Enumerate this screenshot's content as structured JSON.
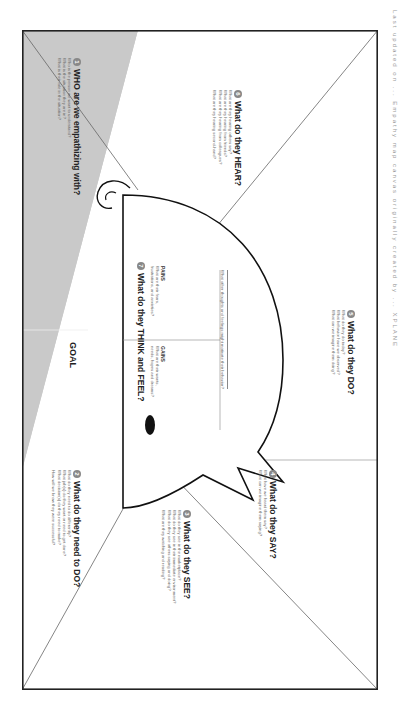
{
  "goal_label": "GOAL",
  "sections": {
    "who": {
      "number": "1",
      "title": "WHO are we empathizing with?",
      "questions": [
        "Who is the person we want to understand?",
        "What is the situation they are in?",
        "What is their role in the situation?"
      ]
    },
    "do_need": {
      "number": "2",
      "title": "What do they need to DO?",
      "questions": [
        "What do they need to do differently?",
        "What job(s) do they want or need to get done?",
        "What decision(s) do they need to make?",
        "How will we know they were successful?"
      ]
    },
    "see": {
      "number": "3",
      "title": "What do they SEE?",
      "questions": [
        "What do they see in the marketplace?",
        "What do they see in their immediate environment?",
        "What do they see others saying and doing?",
        "What are they watching and reading?"
      ]
    },
    "say": {
      "number": "4",
      "title": "What do they SAY?",
      "questions": [
        "What have we heard them say?",
        "What can we imagine them saying?"
      ]
    },
    "do": {
      "number": "5",
      "title": "What do they DO?",
      "questions": [
        "What do they do today?",
        "What behavior have we observed?",
        "What can we imagine them doing?"
      ]
    },
    "hear": {
      "number": "6",
      "title": "What do they HEAR?",
      "questions": [
        "What are they hearing others say?",
        "What are they hearing from friends?",
        "What are they hearing from colleagues?",
        "What are they hearing second-hand?"
      ]
    },
    "think_feel": {
      "number": "7",
      "title": "What do they THINK and FEEL?",
      "pains_label": "PAINS",
      "pains_text": [
        "What are their fears,",
        "frustrations, and anxieties?"
      ],
      "gains_label": "GAINS",
      "gains_text": [
        "What are their wants,",
        "needs, hopes and dreams?"
      ],
      "footer": "What other thoughts and feelings might motivate their behavior?"
    }
  },
  "caption": "Last updated on ... Empathy map canvas originally created by ... XPLANE"
}
